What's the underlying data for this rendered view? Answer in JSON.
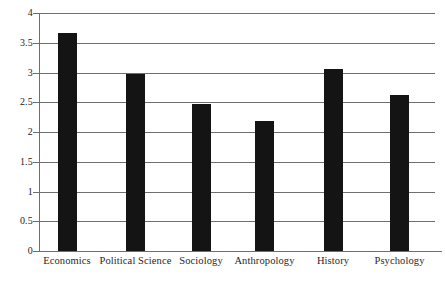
{
  "chart_data": {
    "type": "bar",
    "title": "",
    "subtitle": "",
    "xlabel": "",
    "ylabel": "",
    "categories": [
      "Economics",
      "Political Science",
      "Sociology",
      "Anthropology",
      "History",
      "Psychology"
    ],
    "values": [
      3.67,
      2.98,
      2.47,
      2.18,
      3.06,
      2.62
    ],
    "ylim": [
      0,
      4
    ],
    "ytick_labels": [
      "4",
      "3.5",
      "3",
      "2.5",
      "2",
      "1.5",
      "1",
      "0.5",
      "0"
    ],
    "ytick_values": [
      4,
      3.5,
      3,
      2.5,
      2,
      1.5,
      1,
      0.5,
      0
    ],
    "grid": true,
    "legend": false,
    "legend_position": "none",
    "bar_color": "#141414",
    "grid_color": "#6f6f6f",
    "background_color": "#ffffff"
  }
}
